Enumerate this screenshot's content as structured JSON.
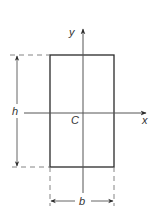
{
  "diagram": {
    "title": "",
    "labels": {
      "y_axis": "y",
      "x_axis": "x",
      "centroid": "C",
      "height": "h",
      "base": "b"
    },
    "colors": {
      "stroke": "#2a2a2a",
      "axis": "#555555",
      "dashed": "#777777",
      "text": "#333333",
      "background": "#ffffff"
    },
    "geometry": {
      "rectangle": {
        "x": 50,
        "y": 55,
        "width": 64,
        "height": 112
      },
      "centroid": {
        "x": 83,
        "y": 113
      },
      "x_axis": {
        "x1": 24,
        "x2": 147,
        "y": 113
      },
      "y_axis": {
        "x": 83,
        "y1": 28,
        "y2": 193
      },
      "h_dimension": {
        "x": 17,
        "y1": 55,
        "y2": 167
      },
      "b_dimension": {
        "y": 201,
        "x1": 50,
        "x2": 114
      }
    }
  }
}
